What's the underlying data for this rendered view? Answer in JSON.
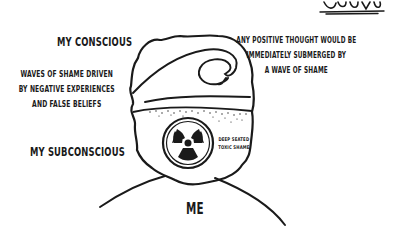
{
  "illustration": {
    "labels": {
      "conscious": "MY CONSCIOUS",
      "positive_thought_lines": [
        "ANY POSITIVE THOUGHT WOULD BE",
        "IMMEDIATELY SUBMERGED BY",
        "A WAVE OF SHAME"
      ],
      "waves_lines": [
        "WAVES OF SHAME DRIVEN",
        "BY NEGATIVE EXPERIENCES",
        "AND FALSE BELIEFS"
      ],
      "subconscious": "MY SUBCONSCIOUS",
      "toxic_lines": [
        "DEEP SEATED",
        "TOXIC SHAME"
      ],
      "me": "ME"
    },
    "icons": {
      "wave": "ocean-wave",
      "radiation": "radiation-trefoil",
      "signature": "artist-signature"
    },
    "colors": {
      "ink": "#1a1a1a",
      "background": "#ffffff"
    }
  }
}
